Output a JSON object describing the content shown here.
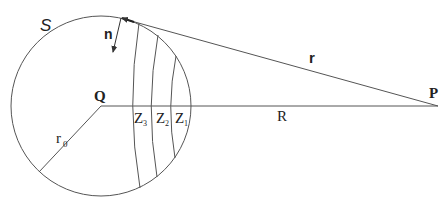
{
  "diagram": {
    "labels": {
      "surface": "S",
      "normal": "n",
      "radius_vector": "r",
      "center": "Q",
      "point": "P",
      "distance": "R",
      "sphere_radius": "r",
      "sphere_radius_sub": "0",
      "zone3": "Z",
      "zone3_sub": "3",
      "zone2": "Z",
      "zone2_sub": "2",
      "zone1": "Z",
      "zone1_sub": "1"
    },
    "colors": {
      "stroke": "#555555",
      "text": "#222222",
      "background": "#ffffff"
    }
  }
}
